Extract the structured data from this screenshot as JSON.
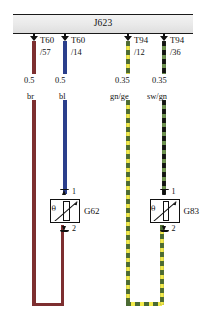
{
  "diagram": {
    "title": "J623",
    "type": "automotive-wiring-diagram"
  },
  "header": {
    "connector_label": "J623"
  },
  "wires": [
    {
      "id": "wire-br",
      "terminal": "T60",
      "pin": "/57",
      "gauge": "0.5",
      "color_code": "br",
      "color_hex": "#7d2f30",
      "style": "solid"
    },
    {
      "id": "wire-bl",
      "terminal": "T60",
      "pin": "/14",
      "gauge": "0.5",
      "color_code": "bl",
      "color_hex": "#2b3f8c",
      "style": "solid"
    },
    {
      "id": "wire-gnge",
      "terminal": "T94",
      "pin": "/12",
      "gauge": "0.35",
      "color_code": "gn/ge",
      "color_hex": "#4a6b33",
      "color_hex_2": "#f2ea4a",
      "style": "dashed"
    },
    {
      "id": "wire-swgn",
      "terminal": "T94",
      "pin": "/36",
      "gauge": "0.35",
      "color_code": "sw/gn",
      "color_hex_2": "#6f9450",
      "color_hex": "#121212",
      "style": "dashed"
    }
  ],
  "components": [
    {
      "id": "component-g62",
      "name": "G62",
      "symbol": "theta",
      "symbol_char": "θ",
      "pin_top": "1",
      "pin_bottom": "2"
    },
    {
      "id": "component-g83",
      "name": "G83",
      "symbol": "theta",
      "symbol_char": "θ",
      "pin_top": "1",
      "pin_bottom": "2"
    }
  ]
}
